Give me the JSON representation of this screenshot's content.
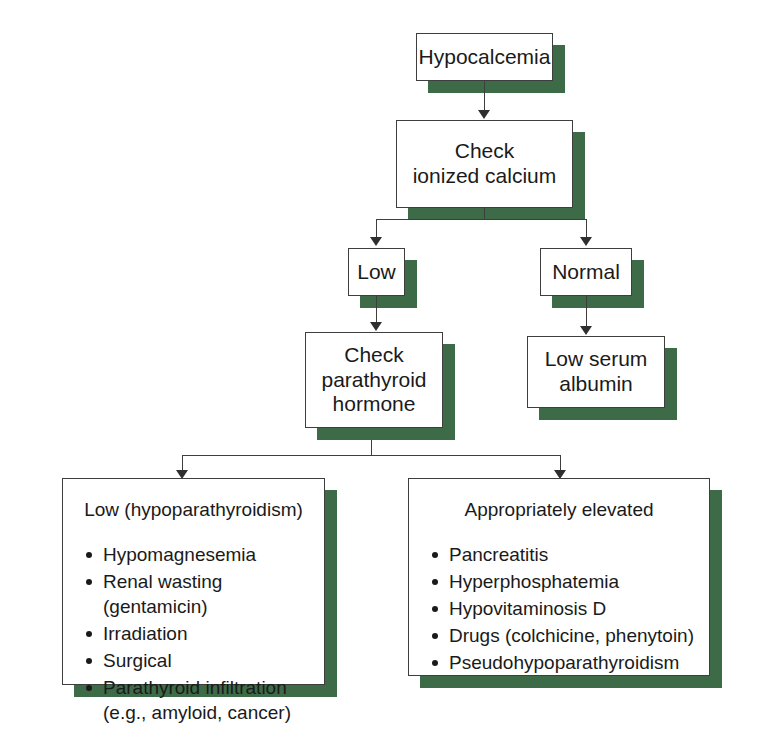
{
  "diagram": {
    "accent_color": "#3e6b47",
    "line_color": "#3e3e3e",
    "nodes": {
      "root": {
        "label": "Hypocalcemia"
      },
      "check_ionized": {
        "label": "Check\nionized calcium"
      },
      "low": {
        "label": "Low"
      },
      "normal": {
        "label": "Normal"
      },
      "check_pth": {
        "label": "Check\nparathyroid\nhormone"
      },
      "low_albumin": {
        "label": "Low serum\nalbumin"
      }
    },
    "outcomes": {
      "left": {
        "title": "Low (hypoparathyroidism)",
        "items": [
          "Hypomagnesemia",
          "Renal wasting (gentamicin)",
          "Irradiation",
          "Surgical",
          "Parathyroid infiltration\n(e.g., amyloid, cancer)"
        ]
      },
      "right": {
        "title": "Appropriately elevated",
        "items": [
          "Pancreatitis",
          "Hyperphosphatemia",
          "Hypovitaminosis D",
          "Drugs (colchicine, phenytoin)",
          "Pseudohypoparathyroidism"
        ]
      }
    }
  }
}
